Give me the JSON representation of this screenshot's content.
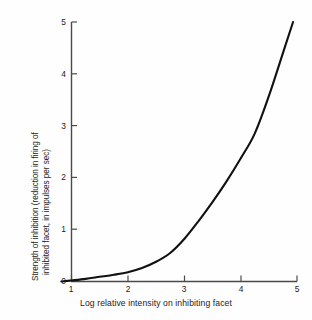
{
  "chart_data": {
    "type": "line",
    "title": "",
    "xlabel": "Log relative intensity on inhibiting facet",
    "ylabel": "Strength of inhibition (reduction in firing of inhibited facet, in impulses per sec)",
    "ylabel_line1": "Strength of inhibition (reduction in firing of",
    "ylabel_line2": "inhibited facet, in impulses per sec)",
    "xlim": [
      0.6,
      5.0
    ],
    "ylim": [
      0,
      5
    ],
    "xticks": [
      "1",
      "2",
      "3",
      "4",
      "5"
    ],
    "yticks": [
      "0",
      "1",
      "2",
      "3",
      "4",
      "5"
    ],
    "xtick_values": [
      1,
      2,
      3,
      4,
      5
    ],
    "ytick_values": [
      0,
      1,
      2,
      3,
      4,
      5
    ],
    "grid": false,
    "legend": "none",
    "series": [
      {
        "name": "Strength of inhibition",
        "color": "#111111",
        "x": [
          0.82,
          1.0,
          1.25,
          1.5,
          1.75,
          2.0,
          2.25,
          2.5,
          2.75,
          3.0,
          3.25,
          3.5,
          3.75,
          4.0,
          4.25,
          4.5,
          4.75,
          4.93
        ],
        "y": [
          0.0,
          0.02,
          0.05,
          0.09,
          0.13,
          0.18,
          0.26,
          0.38,
          0.55,
          0.82,
          1.16,
          1.53,
          1.93,
          2.37,
          2.85,
          3.57,
          4.4,
          5.0
        ]
      }
    ]
  },
  "axes": {
    "x_axis_name": "x-axis-line",
    "y_axis_name": "y-axis-line"
  }
}
